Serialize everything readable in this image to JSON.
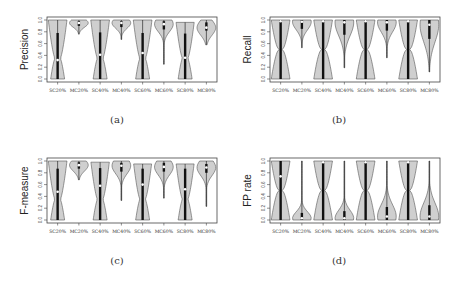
{
  "categories": [
    "SC20%",
    "MC20%",
    "SC40%",
    "MC40%",
    "SC60%",
    "MC60%",
    "SC80%",
    "MC80%"
  ],
  "yticks": [
    "0.0",
    "0.2",
    "0.4",
    "0.6",
    "0.8",
    "1.0"
  ],
  "colors": {
    "violin_fill": "#cfcfcf",
    "violin_stroke": "#555555",
    "box": "#111111",
    "median": "#ffffff",
    "frame": "#444444"
  },
  "chart_data": [
    {
      "type": "violin",
      "panel": "a",
      "caption": "(a)",
      "ylabel": "Precision",
      "ylim": [
        0,
        1
      ],
      "categories": [
        "SC20%",
        "MC20%",
        "SC40%",
        "MC40%",
        "SC60%",
        "MC60%",
        "SC80%",
        "MC80%"
      ],
      "series": [
        {
          "name": "SC20%",
          "min": 0.0,
          "max": 1.0,
          "median": 0.32,
          "q1": 0.0,
          "q3": 0.78
        },
        {
          "name": "MC20%",
          "min": 0.76,
          "max": 1.0,
          "median": 0.95,
          "q1": 0.9,
          "q3": 0.98
        },
        {
          "name": "SC40%",
          "min": 0.0,
          "max": 1.0,
          "median": 0.41,
          "q1": 0.0,
          "q3": 0.79
        },
        {
          "name": "MC40%",
          "min": 0.67,
          "max": 1.0,
          "median": 0.95,
          "q1": 0.88,
          "q3": 0.98
        },
        {
          "name": "SC60%",
          "min": 0.0,
          "max": 1.0,
          "median": 0.44,
          "q1": 0.0,
          "q3": 0.78
        },
        {
          "name": "MC60%",
          "min": 0.25,
          "max": 1.0,
          "median": 0.93,
          "q1": 0.84,
          "q3": 0.98
        },
        {
          "name": "SC80%",
          "min": 0.0,
          "max": 0.96,
          "median": 0.36,
          "q1": 0.0,
          "q3": 0.77
        },
        {
          "name": "MC80%",
          "min": 0.58,
          "max": 1.0,
          "median": 0.87,
          "q1": 0.82,
          "q3": 0.96
        }
      ]
    },
    {
      "type": "violin",
      "panel": "b",
      "caption": "(b)",
      "ylabel": "Recall",
      "ylim": [
        0,
        1
      ],
      "categories": [
        "SC20%",
        "MC20%",
        "SC40%",
        "MC40%",
        "SC60%",
        "MC60%",
        "SC80%",
        "MC80%"
      ],
      "series": [
        {
          "name": "SC20%",
          "min": 0.0,
          "max": 1.0,
          "median": 0.98,
          "q1": 0.0,
          "q3": 1.0
        },
        {
          "name": "MC20%",
          "min": 0.53,
          "max": 1.0,
          "median": 0.97,
          "q1": 0.85,
          "q3": 1.0
        },
        {
          "name": "SC40%",
          "min": 0.0,
          "max": 1.0,
          "median": 0.98,
          "q1": 0.0,
          "q3": 1.0
        },
        {
          "name": "MC40%",
          "min": 0.19,
          "max": 1.0,
          "median": 0.96,
          "q1": 0.75,
          "q3": 1.0
        },
        {
          "name": "SC60%",
          "min": 0.0,
          "max": 1.0,
          "median": 0.98,
          "q1": 0.0,
          "q3": 1.0
        },
        {
          "name": "MC60%",
          "min": 0.36,
          "max": 1.0,
          "median": 0.96,
          "q1": 0.82,
          "q3": 1.0
        },
        {
          "name": "SC80%",
          "min": 0.0,
          "max": 1.0,
          "median": 0.98,
          "q1": 0.0,
          "q3": 1.0
        },
        {
          "name": "MC80%",
          "min": 0.12,
          "max": 1.0,
          "median": 0.92,
          "q1": 0.68,
          "q3": 1.0
        }
      ]
    },
    {
      "type": "violin",
      "panel": "c",
      "caption": "(c)",
      "ylabel": "F-measure",
      "ylim": [
        0,
        1
      ],
      "categories": [
        "SC20%",
        "MC20%",
        "SC40%",
        "MC40%",
        "SC60%",
        "MC60%",
        "SC80%",
        "MC80%"
      ],
      "series": [
        {
          "name": "SC20%",
          "min": 0.0,
          "max": 1.0,
          "median": 0.48,
          "q1": 0.0,
          "q3": 0.87
        },
        {
          "name": "MC20%",
          "min": 0.68,
          "max": 1.0,
          "median": 0.93,
          "q1": 0.87,
          "q3": 0.98
        },
        {
          "name": "SC40%",
          "min": 0.0,
          "max": 0.98,
          "median": 0.58,
          "q1": 0.0,
          "q3": 0.88
        },
        {
          "name": "MC40%",
          "min": 0.33,
          "max": 1.0,
          "median": 0.92,
          "q1": 0.82,
          "q3": 0.97
        },
        {
          "name": "SC60%",
          "min": 0.0,
          "max": 0.95,
          "median": 0.6,
          "q1": 0.0,
          "q3": 0.87
        },
        {
          "name": "MC60%",
          "min": 0.37,
          "max": 1.0,
          "median": 0.9,
          "q1": 0.82,
          "q3": 0.97
        },
        {
          "name": "SC80%",
          "min": 0.0,
          "max": 0.95,
          "median": 0.52,
          "q1": 0.0,
          "q3": 0.87
        },
        {
          "name": "MC80%",
          "min": 0.23,
          "max": 1.0,
          "median": 0.89,
          "q1": 0.8,
          "q3": 0.95
        }
      ]
    },
    {
      "type": "violin",
      "panel": "d",
      "caption": "(d)",
      "ylabel": "FP rate",
      "ylim": [
        0,
        1
      ],
      "categories": [
        "SC20%",
        "MC20%",
        "SC40%",
        "MC40%",
        "SC60%",
        "MC60%",
        "SC80%",
        "MC80%"
      ],
      "series": [
        {
          "name": "SC20%",
          "min": 0.0,
          "max": 1.0,
          "median": 0.74,
          "q1": 0.0,
          "q3": 1.0
        },
        {
          "name": "MC20%",
          "min": 0.0,
          "max": 1.0,
          "median": 0.03,
          "q1": 0.0,
          "q3": 0.12
        },
        {
          "name": "SC40%",
          "min": 0.0,
          "max": 1.0,
          "median": 0.98,
          "q1": 0.0,
          "q3": 1.0
        },
        {
          "name": "MC40%",
          "min": 0.0,
          "max": 1.0,
          "median": 0.03,
          "q1": 0.0,
          "q3": 0.15
        },
        {
          "name": "SC60%",
          "min": 0.0,
          "max": 1.0,
          "median": 0.98,
          "q1": 0.0,
          "q3": 1.0
        },
        {
          "name": "MC60%",
          "min": 0.0,
          "max": 1.0,
          "median": 0.06,
          "q1": 0.0,
          "q3": 0.22
        },
        {
          "name": "SC80%",
          "min": 0.0,
          "max": 1.0,
          "median": 0.98,
          "q1": 0.0,
          "q3": 1.0
        },
        {
          "name": "MC80%",
          "min": 0.0,
          "max": 1.0,
          "median": 0.06,
          "q1": 0.0,
          "q3": 0.25
        }
      ]
    }
  ]
}
